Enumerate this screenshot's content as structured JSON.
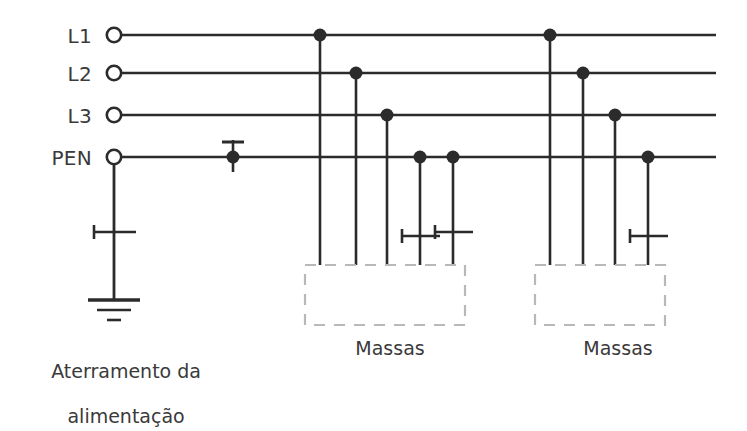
{
  "figure": {
    "type": "electrical-earthing-diagram",
    "stroke_color": "#2b2b2b",
    "text_color": "#3a3a3a",
    "dashed_box_color": "#b8b8b8",
    "background_color": "#ffffff"
  },
  "rails": [
    {
      "id": "L1",
      "label": "L1",
      "y": 35,
      "terminal_x": 114,
      "end_x": 716
    },
    {
      "id": "L2",
      "label": "L2",
      "y": 73,
      "terminal_x": 114,
      "end_x": 716
    },
    {
      "id": "L3",
      "label": "L3",
      "y": 115,
      "terminal_x": 114,
      "end_x": 716
    },
    {
      "id": "PEN",
      "label": "PEN",
      "y": 157,
      "terminal_x": 114,
      "end_x": 716
    }
  ],
  "rail_labels": [
    {
      "text": "L1",
      "x": 62,
      "y": 24
    },
    {
      "text": "L2",
      "x": 62,
      "y": 62
    },
    {
      "text": "L3",
      "x": 62,
      "y": 104
    },
    {
      "text": "PEN",
      "x": 46,
      "y": 146
    }
  ],
  "source_earth": {
    "drop_x": 114,
    "from_y": 157,
    "to_y": 300,
    "pe_mark_y": 232,
    "ground_bars": [
      {
        "y": 300,
        "half_width": 26,
        "thickness": 3.4
      },
      {
        "y": 310,
        "half_width": 17,
        "thickness": 2.6
      },
      {
        "y": 320,
        "half_width": 7,
        "thickness": 2.6
      }
    ]
  },
  "pen_tap": {
    "x": 233,
    "rail_y": 157,
    "dot_radius": 6.5,
    "stub_top_y": 140,
    "stub_bottom_y": 172,
    "bar_y": 142,
    "bar_half_width": 11
  },
  "load_groups": [
    {
      "name": "left-load-group",
      "label": "Massas",
      "label_x": 390,
      "label_y": 337,
      "box": {
        "x": 305,
        "y": 265,
        "width": 160,
        "height": 60
      },
      "drops": [
        {
          "rail": "L1",
          "x": 320,
          "rail_y": 35,
          "bottom_y": 265,
          "dot": true,
          "pe_mark": false
        },
        {
          "rail": "L2",
          "x": 356,
          "rail_y": 73,
          "bottom_y": 265,
          "dot": true,
          "pe_mark": false
        },
        {
          "rail": "L3",
          "x": 387,
          "rail_y": 115,
          "bottom_y": 265,
          "dot": true,
          "pe_mark": false
        },
        {
          "rail": "PEN",
          "x": 420,
          "rail_y": 157,
          "bottom_y": 265,
          "dot": true,
          "pe_mark": true,
          "pe_mark_y": 236
        },
        {
          "rail": "PEN",
          "x": 453,
          "rail_y": 157,
          "bottom_y": 265,
          "dot": true,
          "pe_mark": true,
          "pe_mark_y": 232
        }
      ]
    },
    {
      "name": "right-load-group",
      "label": "Massas",
      "label_x": 618,
      "label_y": 337,
      "box": {
        "x": 535,
        "y": 265,
        "width": 130,
        "height": 60
      },
      "drops": [
        {
          "rail": "L1",
          "x": 550,
          "rail_y": 35,
          "bottom_y": 265,
          "dot": true,
          "pe_mark": false
        },
        {
          "rail": "L2",
          "x": 583,
          "rail_y": 73,
          "bottom_y": 265,
          "dot": true,
          "pe_mark": false
        },
        {
          "rail": "L3",
          "x": 615,
          "rail_y": 115,
          "bottom_y": 265,
          "dot": true,
          "pe_mark": false
        },
        {
          "rail": "PEN",
          "x": 648,
          "rail_y": 157,
          "bottom_y": 265,
          "dot": true,
          "pe_mark": true,
          "pe_mark_y": 236
        }
      ]
    }
  ],
  "captions": [
    {
      "name": "source-earth-caption",
      "line1": "Aterramento da",
      "line2": "alimentação",
      "x": 114,
      "y": 338
    },
    {
      "name": "left-masses-caption",
      "text": "Massas",
      "x": 390,
      "y": 337
    },
    {
      "name": "right-masses-caption",
      "text": "Massas",
      "x": 618,
      "y": 337
    }
  ]
}
